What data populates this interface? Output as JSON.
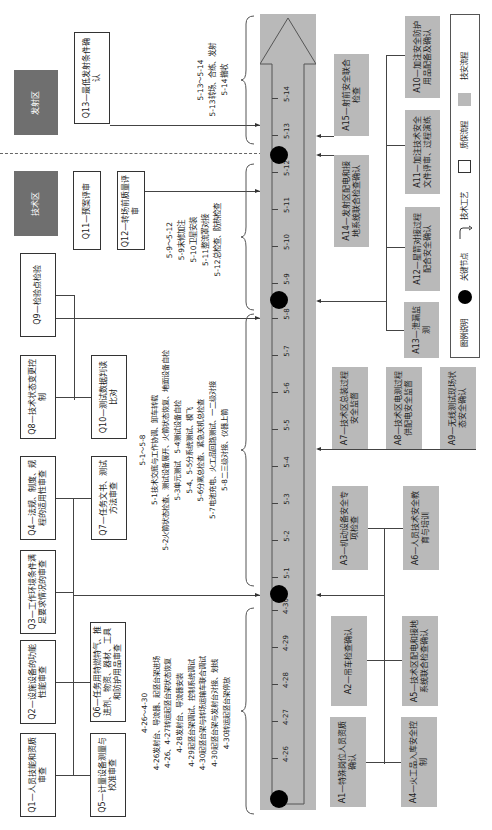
{
  "zones": {
    "launch": "发射区",
    "technical": "技术区"
  },
  "timeline": {
    "ticks": [
      "4-26",
      "4-27",
      "4-28",
      "4-29",
      "4-30",
      "5-1",
      "5-2",
      "5-3",
      "5-4",
      "5-5",
      "5-6",
      "5-7",
      "5-8",
      "5-9",
      "5-10",
      "5-11",
      "5-12",
      "5-13",
      "5-14"
    ],
    "arrow_fill": "#b9b9b9",
    "key_nodes": [
      "4-26 start",
      "4-30/5-1",
      "5-8/5-9",
      "5-12/5-13"
    ]
  },
  "quality": {
    "Q1": "Q1—人员技能和资质审查",
    "Q2": "Q2—设施设备的功能性能审查",
    "Q3": "Q3—工作环境条件满足要求情况的审查",
    "Q4": "Q4—法规、制度、规程的适用性审查",
    "Q5": "Q5—计量设备测量与校准审查",
    "Q6": "Q6—任务用特燃特气、推进剂、物资、器材、工具和防护用品审查",
    "Q7": "Q7—任务文书、测试方法审查",
    "Q8": "Q8—技术状态变更控制",
    "Q9": "Q9—检验点检验",
    "Q10": "Q10—测试数据判读比对",
    "Q11": "Q11—预案评审",
    "Q12": "Q12—转场前质量评审",
    "Q13": "Q13—最低发射条件确认"
  },
  "safety": {
    "A1": "A1—特殊岗位人员资质确认",
    "A2": "A2—吊车检查确认",
    "A3": "A3—机动设备安全专项检查",
    "A4": "A4—火工品入库安全控制",
    "A5": "A5—技术区配电和接地系统联合检查确认",
    "A6": "A6—人员技术安全教育与培训",
    "A7": "A7—技术区总装过程安全监督",
    "A8": "A8—技术区电测过程供配电安全监督",
    "A9": "A9—无线测试现场状态安全确认",
    "A10": "A10—加注安全防护用品配备及确认",
    "A11": "A11—加注技术安全文件评审、过程演练",
    "A12": "A12—星箭对接过程配合安全确认",
    "A13": "A13—泄漏监测",
    "A14": "A14—发射区配电和接地系统联合检查确认",
    "A15": "A15—射前安全联合检查"
  },
  "processes": {
    "p1": {
      "title": "4-26～4-30",
      "lines": [
        "4-26发射台、导流器、起竖台架进场",
        "4-26、4-27转运起竖台架状态恢复",
        "4-28发射台、导流器安装",
        "4-29起竖台架调试、控制系统调试",
        "4-30起竖台架与转场运输车联合调试",
        "4-30起竖台架与发射台对接、划线",
        "4-30转运起竖台架停放"
      ]
    },
    "p2": {
      "title": "5-1～5-8",
      "lines": [
        "5-1技术交底与工作协调、卸车转载",
        "5-2火箭状态检查、测试设备展开、火箭状态恢复、地面设备自检",
        "5-3单元测试　5-4测试设备自检",
        "5-4、5-5分系统测试、模飞",
        "5-6分离总检查、紧急关机总检查",
        "5-7电池充电、火工品回路测试、一二级对接",
        "5-8二三级对接、仪器上箭"
      ]
    },
    "p3": {
      "title": "5-9～5-12",
      "lines": [
        "5-9末修加注",
        "5-10卫星安装",
        "5-11整流罩对接",
        "5-12总检查、防热检查"
      ]
    },
    "p4": {
      "title": "5-13～5-14",
      "lines": [
        "5-13转场、合练、发射",
        "5-14撤收"
      ]
    }
  },
  "legend": {
    "title": "图例说明",
    "key_node": "关键节点",
    "tech_process": "技术工艺",
    "quality_process": "质保流程",
    "safety_process": "技安流程"
  },
  "colors": {
    "safety_fill": "#b9b9b9",
    "zone_fill": "#6f6f6f",
    "line": "#444444"
  }
}
